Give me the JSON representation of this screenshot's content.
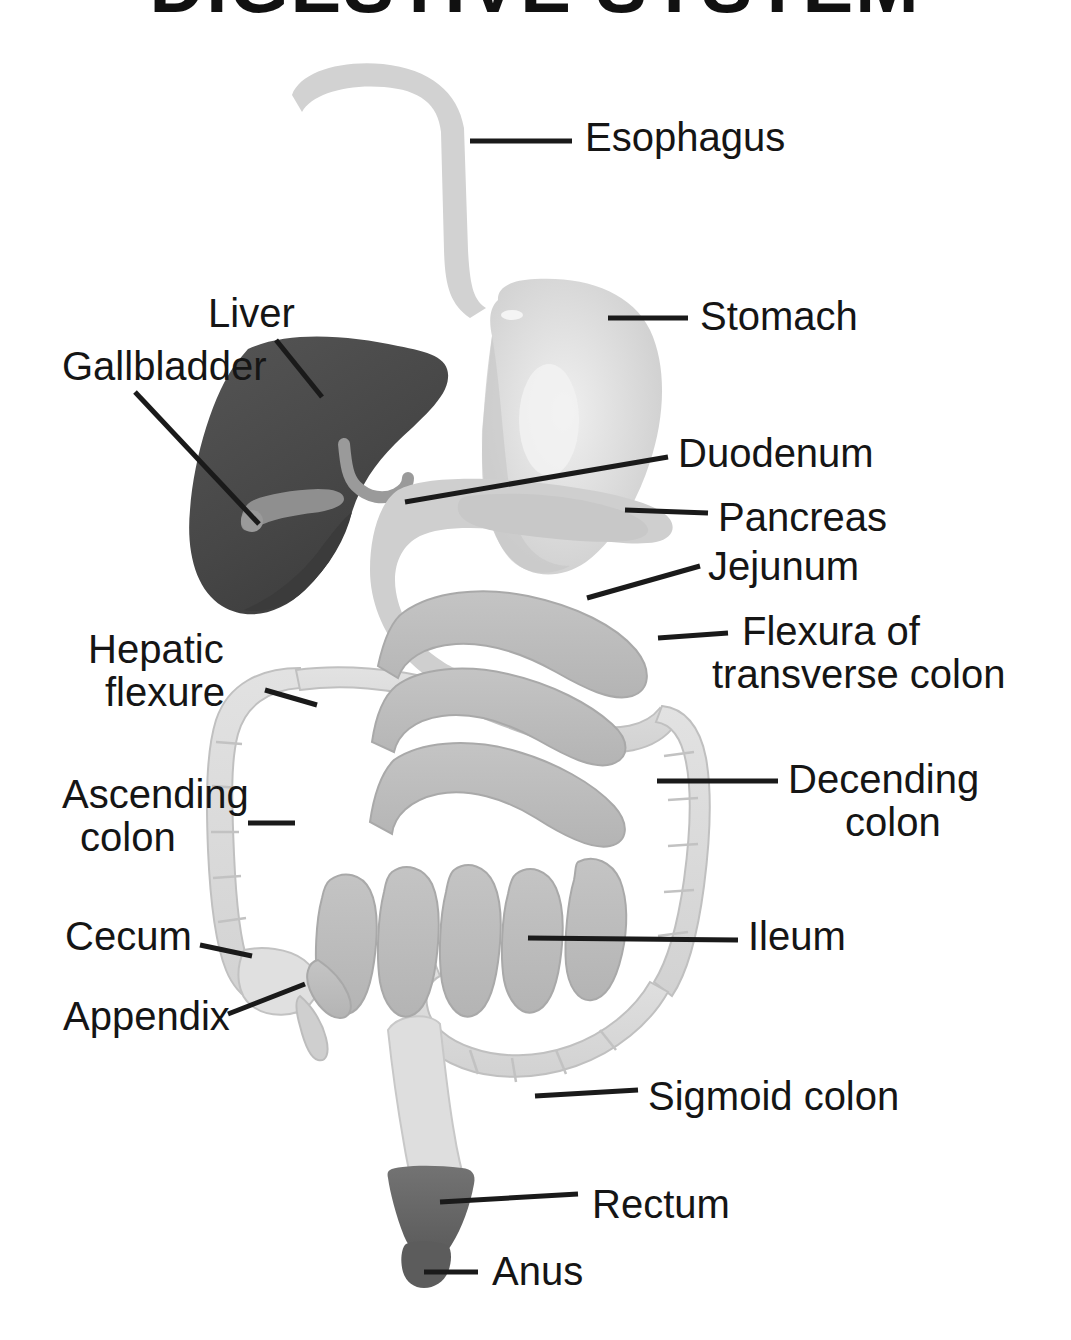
{
  "title": {
    "text": "DIGESTIVE SYSTEM",
    "clipped": true
  },
  "colors": {
    "background": "#ffffff",
    "text": "#151515",
    "leader_line": "#1a1a1a",
    "liver": "#4a4a4a",
    "liver_shadow": "#3b3b3b",
    "gallbladder": "#8f8f8f",
    "bile_duct": "#9a9a9a",
    "stomach": "#d6d6d6",
    "stomach_highlight": "#ededed",
    "esophagus": "#d2d2d2",
    "duodenum": "#cfcfcf",
    "pancreas": "#c8c8c8",
    "small_intestine": "#bdbdbd",
    "large_intestine": "#dcdcdc",
    "colon_outline": "#b5b5b5",
    "rectum": "#6a6a6a",
    "anus": "#5c5c5c"
  },
  "labels": [
    {
      "id": "esophagus",
      "text": "Esophagus",
      "text2": "",
      "side": "right",
      "text_x": 585,
      "text_y": 151,
      "leader": "M 470 141 L 572 141"
    },
    {
      "id": "stomach",
      "text": "Stomach",
      "text2": "",
      "side": "right",
      "text_x": 700,
      "text_y": 330,
      "leader": "M 608 318 L 688 318"
    },
    {
      "id": "liver",
      "text": "Liver",
      "text2": "",
      "side": "left",
      "text_x": 208,
      "text_y": 327,
      "leader": "M 276 340 L 322 397"
    },
    {
      "id": "gallbladder",
      "text": "Gallbladder",
      "text2": "",
      "side": "left",
      "text_x": 62,
      "text_y": 380,
      "leader": "M 135 392 L 259 524"
    },
    {
      "id": "duodenum",
      "text": "Duodenum",
      "text2": "",
      "side": "right",
      "text_x": 678,
      "text_y": 467,
      "leader": "M 405 502 L 668 457"
    },
    {
      "id": "pancreas",
      "text": "Pancreas",
      "text2": "",
      "side": "right",
      "text_x": 718,
      "text_y": 531,
      "leader": "M 625 510 L 708 513"
    },
    {
      "id": "jejunum",
      "text": "Jejunum",
      "text2": "",
      "side": "right",
      "text_x": 708,
      "text_y": 580,
      "leader": "M 587 598 L 700 566"
    },
    {
      "id": "flexura",
      "text": "Flexura of",
      "text2": "transverse colon",
      "side": "right",
      "text_x": 742,
      "text_y": 645,
      "leader": "M 658 638 L 728 633"
    },
    {
      "id": "hepatic",
      "text": "Hepatic",
      "text2": "flexure",
      "side": "left",
      "text_x": 88,
      "text_y": 663,
      "leader": "M 265 690 L 317 705"
    },
    {
      "id": "ascending",
      "text": "Ascending",
      "text2": "colon",
      "side": "left",
      "text_x": 62,
      "text_y": 808,
      "leader": "M 248 823 L 295 823"
    },
    {
      "id": "decending",
      "text": "Decending",
      "text2": "colon",
      "side": "right",
      "text_x": 788,
      "text_y": 793,
      "leader": "M 657 781 L 778 781"
    },
    {
      "id": "cecum",
      "text": "Cecum",
      "text2": "",
      "side": "left",
      "text_x": 65,
      "text_y": 950,
      "leader": "M 200 945 L 252 956"
    },
    {
      "id": "ileum",
      "text": "Ileum",
      "text2": "",
      "side": "right",
      "text_x": 748,
      "text_y": 950,
      "leader": "M 528 938 L 738 940"
    },
    {
      "id": "appendix",
      "text": "Appendix",
      "text2": "",
      "side": "left",
      "text_x": 63,
      "text_y": 1030,
      "leader": "M 228 1014 L 305 984"
    },
    {
      "id": "sigmoid",
      "text": "Sigmoid colon",
      "text2": "",
      "side": "right",
      "text_x": 648,
      "text_y": 1110,
      "leader": "M 535 1096 L 638 1090"
    },
    {
      "id": "rectum",
      "text": "Rectum",
      "text2": "",
      "side": "right",
      "text_x": 592,
      "text_y": 1218,
      "leader": "M 440 1202 L 578 1194"
    },
    {
      "id": "anus",
      "text": "Anus",
      "text2": "",
      "side": "right",
      "text_x": 492,
      "text_y": 1285,
      "leader": "M 424 1272 L 478 1272"
    }
  ],
  "organs": [
    {
      "id": "esophagus",
      "name": "Esophagus"
    },
    {
      "id": "stomach",
      "name": "Stomach"
    },
    {
      "id": "liver",
      "name": "Liver"
    },
    {
      "id": "gallbladder",
      "name": "Gallbladder"
    },
    {
      "id": "duodenum",
      "name": "Duodenum"
    },
    {
      "id": "pancreas",
      "name": "Pancreas"
    },
    {
      "id": "jejunum",
      "name": "Jejunum"
    },
    {
      "id": "ileum",
      "name": "Ileum"
    },
    {
      "id": "transverse-colon",
      "name": "Transverse colon"
    },
    {
      "id": "ascending-colon",
      "name": "Ascending colon"
    },
    {
      "id": "decending-colon",
      "name": "Decending colon"
    },
    {
      "id": "cecum",
      "name": "Cecum"
    },
    {
      "id": "appendix",
      "name": "Appendix"
    },
    {
      "id": "sigmoid-colon",
      "name": "Sigmoid colon"
    },
    {
      "id": "rectum",
      "name": "Rectum"
    },
    {
      "id": "anus",
      "name": "Anus"
    }
  ]
}
